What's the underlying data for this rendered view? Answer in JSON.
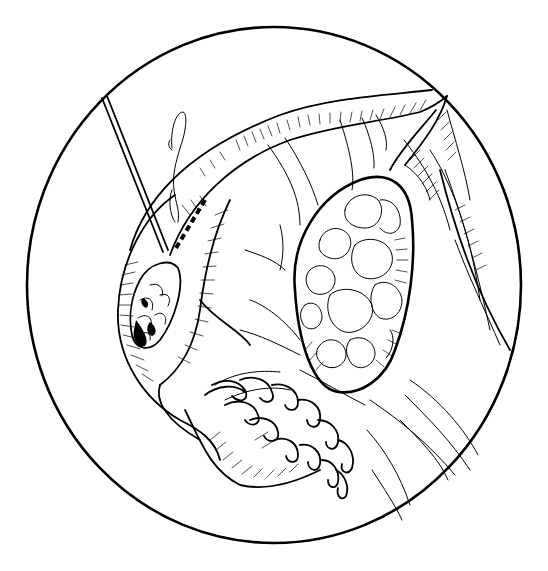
{
  "figure": {
    "description": "Circular black-and-white medical line illustration of pelvic organs: a tubular structure with a probe/instrument pointing to a dark granular lesion, a suture needle and a dashed incision line, an oval lobulated mass on the right, and fimbriated tube end at the bottom.",
    "frame": {
      "shape": "circle",
      "cx": 274,
      "cy": 285,
      "rx": 247,
      "ry": 258,
      "stroke": "#000000"
    },
    "colors": {
      "ink": "#000000",
      "background": "#ffffff"
    },
    "elements": {
      "probe": "instrument-probe",
      "suture": "suture-needle-loop",
      "incision": "dashed-incision-line",
      "lesion": "dark-granular-lesion",
      "mass": "lobulated-oval-mass",
      "fimbriae": "fimbriated-end",
      "tube": "tubular-organ"
    }
  }
}
